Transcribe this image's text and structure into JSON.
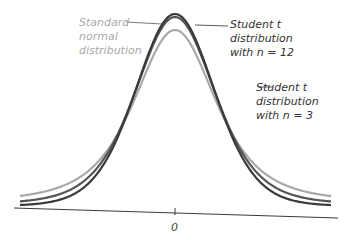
{
  "chart_data": {
    "type": "line",
    "title": "",
    "xlabel": "",
    "ylabel": "",
    "x_ticks": [
      "0"
    ],
    "grid": false,
    "legend": "inline leader-line labels",
    "note": "Values are visual approximations read from the drawn curves, not computed densities. As drawn, the gray curve (attributed to the standard normal via its leader line) has the lowest peak and the highest tails; the true standard normal has the highest peak and the lightest tails, so either the source figure is schematic or the label-to-curve attribution is ambiguous.",
    "series": [
      {
        "name": "Standard normal distribution",
        "color": "#a9a9a9",
        "drawn_peak": "lowest of the three",
        "drawn_tail": "highest of the three"
      },
      {
        "name": "Student t distribution with n = 12",
        "color": "#3a3a3a",
        "drawn_peak": "highest (outermost dark curve)",
        "drawn_tail": "lowest of the three"
      },
      {
        "name": "Student t distribution with n = 3",
        "color": "#555555",
        "drawn_peak": "middle (inner dark curve)",
        "drawn_tail": "middle"
      }
    ]
  },
  "labels": {
    "normal": [
      "Standard",
      "normal",
      "distribution"
    ],
    "t12": [
      "Student t",
      "distribution",
      "with n = 12"
    ],
    "t3": [
      "Student t",
      "distribution",
      "with n = 3"
    ]
  },
  "axis": {
    "zero_label": "0"
  }
}
